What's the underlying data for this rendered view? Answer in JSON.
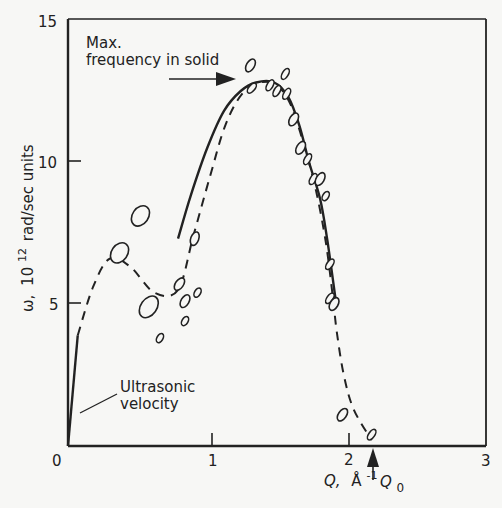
{
  "chart_data": {
    "type": "scatter",
    "title": "",
    "xlabel": "Q, Å⁻¹",
    "ylabel": "ω, 10¹² rad/sec units",
    "xlim": [
      0,
      3
    ],
    "ylim": [
      0,
      15
    ],
    "grid": false,
    "legend": "none",
    "x_ticks": [
      0,
      1,
      2,
      3
    ],
    "y_ticks": [
      5,
      10,
      15
    ],
    "x_tick_labels": [
      "0",
      "1",
      "2",
      "3"
    ],
    "y_tick_labels": [
      "5",
      "10",
      "15"
    ],
    "series": [
      {
        "name": "Measured points (ellipses)",
        "style": "open-ellipse",
        "points": [
          {
            "x": 0.37,
            "y": 6.8,
            "rx": 8,
            "ry": 11,
            "rot": 35
          },
          {
            "x": 0.52,
            "y": 8.1,
            "rx": 8,
            "ry": 11,
            "rot": 35
          },
          {
            "x": 0.58,
            "y": 4.9,
            "rx": 8,
            "ry": 12,
            "rot": 35
          },
          {
            "x": 0.66,
            "y": 3.8,
            "rx": 3,
            "ry": 5,
            "rot": 30
          },
          {
            "x": 0.8,
            "y": 5.7,
            "rx": 4,
            "ry": 7,
            "rot": 35
          },
          {
            "x": 0.84,
            "y": 5.1,
            "rx": 4,
            "ry": 7,
            "rot": 30
          },
          {
            "x": 0.84,
            "y": 4.4,
            "rx": 3,
            "ry": 5,
            "rot": 30
          },
          {
            "x": 0.93,
            "y": 5.4,
            "rx": 3,
            "ry": 5,
            "rot": 30
          },
          {
            "x": 0.91,
            "y": 7.3,
            "rx": 4,
            "ry": 7,
            "rot": 20
          },
          {
            "x": 1.31,
            "y": 13.4,
            "rx": 4,
            "ry": 7,
            "rot": 30
          },
          {
            "x": 1.32,
            "y": 12.6,
            "rx": 3,
            "ry": 6,
            "rot": 40
          },
          {
            "x": 1.45,
            "y": 12.7,
            "rx": 3,
            "ry": 6,
            "rot": 30
          },
          {
            "x": 1.5,
            "y": 12.5,
            "rx": 3,
            "ry": 6,
            "rot": 30
          },
          {
            "x": 1.56,
            "y": 13.1,
            "rx": 3,
            "ry": 6,
            "rot": 30
          },
          {
            "x": 1.57,
            "y": 12.4,
            "rx": 3,
            "ry": 6,
            "rot": 30
          },
          {
            "x": 1.62,
            "y": 11.5,
            "rx": 4,
            "ry": 7,
            "rot": 30
          },
          {
            "x": 1.67,
            "y": 10.5,
            "rx": 4,
            "ry": 7,
            "rot": 30
          },
          {
            "x": 1.72,
            "y": 10.1,
            "rx": 3,
            "ry": 6,
            "rot": 30
          },
          {
            "x": 1.76,
            "y": 9.4,
            "rx": 3,
            "ry": 6,
            "rot": 30
          },
          {
            "x": 1.81,
            "y": 9.4,
            "rx": 4,
            "ry": 7,
            "rot": 30
          },
          {
            "x": 1.85,
            "y": 8.8,
            "rx": 3,
            "ry": 5,
            "rot": 30
          },
          {
            "x": 1.88,
            "y": 6.4,
            "rx": 3,
            "ry": 6,
            "rot": 35
          },
          {
            "x": 1.88,
            "y": 5.2,
            "rx": 3,
            "ry": 6,
            "rot": 35
          },
          {
            "x": 1.91,
            "y": 5.0,
            "rx": 4,
            "ry": 7,
            "rot": 30
          },
          {
            "x": 1.97,
            "y": 1.1,
            "rx": 4,
            "ry": 7,
            "rot": 35
          },
          {
            "x": 2.18,
            "y": 0.4,
            "rx": 3,
            "ry": 6,
            "rot": 35
          }
        ]
      },
      {
        "name": "Solid curve (solid dispersion)",
        "style": "solid",
        "points": [
          {
            "x": 0.79,
            "y": 7.3
          },
          {
            "x": 0.88,
            "y": 8.8
          },
          {
            "x": 1.0,
            "y": 10.5
          },
          {
            "x": 1.12,
            "y": 11.8
          },
          {
            "x": 1.24,
            "y": 12.5
          },
          {
            "x": 1.35,
            "y": 12.8
          },
          {
            "x": 1.48,
            "y": 12.8
          },
          {
            "x": 1.58,
            "y": 12.3
          },
          {
            "x": 1.66,
            "y": 11.3
          },
          {
            "x": 1.73,
            "y": 10.0
          },
          {
            "x": 1.81,
            "y": 8.7
          },
          {
            "x": 1.86,
            "y": 7.3
          },
          {
            "x": 1.92,
            "y": 5.2
          }
        ]
      },
      {
        "name": "Dashed curve (liquid)",
        "style": "dashed",
        "points": [
          {
            "x": 0.07,
            "y": 3.9
          },
          {
            "x": 0.18,
            "y": 5.6
          },
          {
            "x": 0.3,
            "y": 6.6
          },
          {
            "x": 0.45,
            "y": 6.3
          },
          {
            "x": 0.62,
            "y": 5.4
          },
          {
            "x": 0.79,
            "y": 5.5
          },
          {
            "x": 0.9,
            "y": 7.4
          },
          {
            "x": 1.02,
            "y": 9.5
          },
          {
            "x": 1.13,
            "y": 11.3
          },
          {
            "x": 1.25,
            "y": 12.4
          },
          {
            "x": 1.38,
            "y": 12.8
          },
          {
            "x": 1.5,
            "y": 12.7
          },
          {
            "x": 1.6,
            "y": 12.0
          },
          {
            "x": 1.7,
            "y": 10.5
          },
          {
            "x": 1.78,
            "y": 9.0
          },
          {
            "x": 1.85,
            "y": 7.2
          },
          {
            "x": 1.9,
            "y": 5.3
          },
          {
            "x": 1.93,
            "y": 4.0
          },
          {
            "x": 1.98,
            "y": 2.5
          },
          {
            "x": 2.05,
            "y": 1.3
          },
          {
            "x": 2.18,
            "y": 0.2
          }
        ]
      },
      {
        "name": "Ultrasonic velocity line",
        "style": "solid",
        "points": [
          {
            "x": 0.0,
            "y": 0.0
          },
          {
            "x": 0.07,
            "y": 3.9
          }
        ]
      }
    ],
    "annotations": [
      {
        "text_lines": [
          "Max.",
          "frequency in solid"
        ],
        "arrow_to": {
          "x": 1.27,
          "y": 12.9
        },
        "arrow_from": {
          "x": 0.82,
          "y": 12.9
        }
      },
      {
        "text_lines": [
          "Ultrasonic",
          "velocity"
        ],
        "pointer_to": {
          "x": 0.04,
          "y": 2.1
        }
      },
      {
        "text": "Q₀",
        "arrow_up_to": {
          "x": 2.18,
          "y": 0.0
        },
        "q0_value": 2.18
      }
    ]
  },
  "labels": {
    "ylabel_main": "ω,",
    "ylabel_exp_base": "10",
    "ylabel_exp": "12",
    "ylabel_rest": "rad/sec units",
    "xlabel_main": "Q,",
    "xlabel_unit": "Å",
    "xlabel_exp": "-1",
    "max_freq_line1": "Max.",
    "max_freq_line2": "frequency in solid",
    "ultrasonic_line1": "Ultrasonic",
    "ultrasonic_line2": "velocity",
    "q0_main": "Q",
    "q0_sub": "0",
    "tick_x0": "0",
    "tick_x1": "1",
    "tick_x2": "2",
    "tick_x3": "3",
    "tick_y5": "5",
    "tick_y10": "10",
    "tick_y15": "15"
  }
}
